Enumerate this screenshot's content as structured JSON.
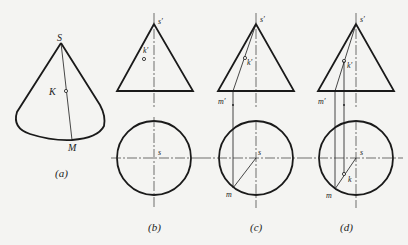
{
  "figure": {
    "panels": [
      {
        "id": "a",
        "caption": "(a)",
        "labels": {
          "apex": "S",
          "point": "K",
          "base_point": "M"
        }
      },
      {
        "id": "b",
        "caption": "(b)",
        "labels": {
          "apex_front": "s′",
          "point_front": "k′",
          "apex_top": "s"
        }
      },
      {
        "id": "c",
        "caption": "(c)",
        "labels": {
          "apex_front": "s′",
          "point_front": "k′",
          "base_front": "m′",
          "apex_top": "s",
          "base_top": "m"
        }
      },
      {
        "id": "d",
        "caption": "(d)",
        "labels": {
          "apex_front": "s′",
          "point_front": "k′",
          "base_front": "m′",
          "apex_top": "s",
          "point_top": "k",
          "base_top": "m"
        }
      }
    ]
  }
}
